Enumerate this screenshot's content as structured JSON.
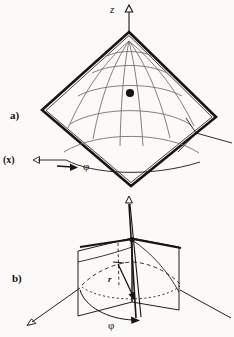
{
  "figure": {
    "background_color": "#fbfaf8",
    "ink_color": "#17150f",
    "grid_color": "#6d6a63",
    "width": 234,
    "height": 337,
    "panels": [
      {
        "id": "a",
        "label": "a)",
        "description": "spherical surface patch inside a rotated square (diamond) frame with curved meridian and parallel grid lines and a marked point",
        "labels": {
          "vertical_axis": "z",
          "horizontal_axis": "(x)",
          "azimuth": "φ"
        }
      },
      {
        "id": "b",
        "label": "b)",
        "description": "two intersecting vertical half planes over a dashed circular base arc with radial vector and azimuth angle",
        "labels": {
          "radial_vector": "r",
          "azimuth": "φ"
        }
      }
    ],
    "markers": {
      "point_on_surface": "filled-dot",
      "axis_arrowheads": "open-triangle"
    }
  },
  "labels": {
    "panel_a": "a)",
    "panel_b": "b)",
    "axis_z": "z",
    "axis_x": "(x)",
    "phi_a": "φ",
    "phi_b": "φ",
    "vector_r": "r"
  }
}
